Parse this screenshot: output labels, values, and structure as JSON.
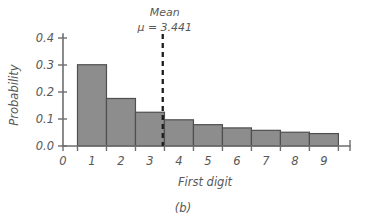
{
  "figure": {
    "caption": "(b)",
    "background_color": "#ffffff",
    "bar_fill_color": "#8d8d8d",
    "bar_edge_color": "#4f4f4f",
    "axis_color": "#6e6e6e",
    "mean_line_color": "#1d1d1d"
  },
  "annotation": {
    "mean_label": "Mean",
    "mean_value_text": "μ = 3.441",
    "mean_value": 3.441
  },
  "chart_data": {
    "type": "bar",
    "title": "",
    "subtitle": "",
    "xlabel": "First digit",
    "ylabel": "Probability",
    "categories": [
      "1",
      "2",
      "3",
      "4",
      "5",
      "6",
      "7",
      "8",
      "9"
    ],
    "values": [
      0.301,
      0.176,
      0.125,
      0.097,
      0.079,
      0.067,
      0.058,
      0.051,
      0.046
    ],
    "xlim": [
      0,
      9.9
    ],
    "ylim": [
      0.0,
      0.4
    ],
    "x_tick_labels": [
      "0",
      "1",
      "2",
      "3",
      "4",
      "5",
      "6",
      "7",
      "8",
      "9"
    ],
    "x_tick_values": [
      0,
      1,
      2,
      3,
      4,
      5,
      6,
      7,
      8,
      9
    ],
    "y_tick_labels": [
      "0.0",
      "0.1",
      "0.2",
      "0.3",
      "0.4"
    ],
    "y_tick_values": [
      0.0,
      0.1,
      0.2,
      0.3,
      0.4
    ],
    "grid": false,
    "legend": false,
    "annotations": [
      {
        "type": "vline",
        "x": 3.441,
        "style": "dashed",
        "label": "Mean μ = 3.441"
      }
    ]
  }
}
